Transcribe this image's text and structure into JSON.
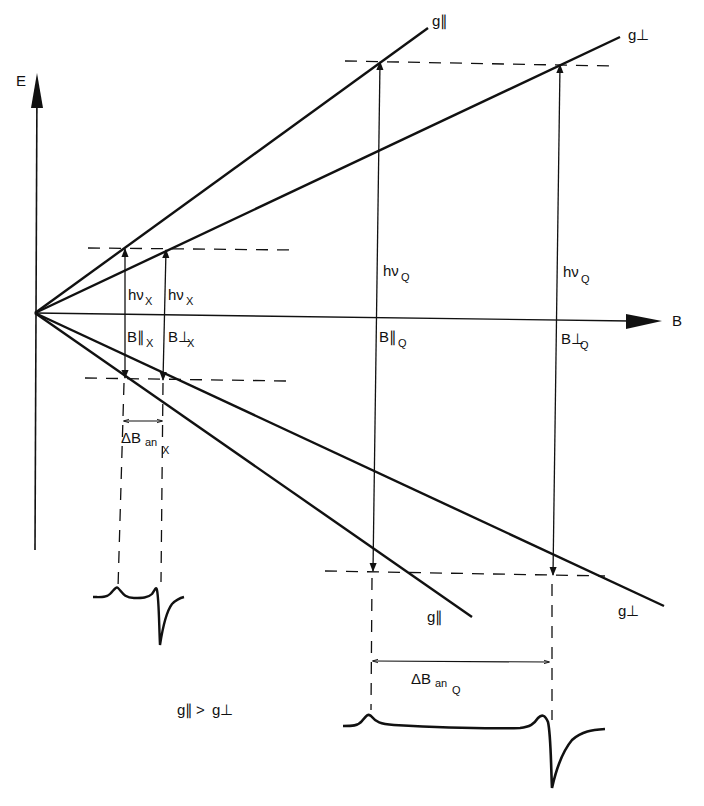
{
  "axes": {
    "y_label": "E",
    "x_label": "B"
  },
  "lines": {
    "g_par_upper": "g∥",
    "g_perp_upper": "g⊥",
    "g_par_lower": "g∥",
    "g_perp_lower": "g⊥"
  },
  "xband": {
    "hv_par": "hν",
    "hv_par_sub": "X",
    "hv_perp": "hν",
    "hv_perp_sub": "X",
    "b_par": "B∥",
    "b_par_sub": "X",
    "b_perp": "B⊥",
    "b_perp_sub": "X",
    "delta": "ΔB",
    "delta_sub": "an",
    "delta_subsub": "X"
  },
  "qband": {
    "hv_par": "hν",
    "hv_par_sub": "Q",
    "hv_perp": "hν",
    "hv_perp_sub": "Q",
    "b_par": "B∥",
    "b_par_sub": "Q",
    "b_perp": "B⊥",
    "b_perp_sub": "Q",
    "delta": "ΔB",
    "delta_sub": "an",
    "delta_subsub": "Q"
  },
  "condition": {
    "left": "g∥",
    "op": ">",
    "right": "g⊥"
  },
  "colors": {
    "ink": "#111111",
    "background": "#ffffff"
  }
}
